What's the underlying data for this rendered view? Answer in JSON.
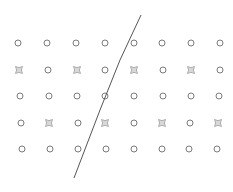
{
  "diagram": {
    "colors": {
      "circle": "#7a7a7a",
      "star": "#9a9a9a",
      "line": "#555555",
      "background": "#ffffff"
    },
    "grid": {
      "rows": [
        {
          "y": 43,
          "xs": [
            18,
            47,
            76,
            105,
            134,
            162,
            191,
            220
          ],
          "types": [
            "o",
            "o",
            "o",
            "o",
            "o",
            "o",
            "o",
            "o"
          ]
        },
        {
          "y": 70,
          "xs": [
            19,
            48,
            77,
            105,
            134,
            163,
            191,
            220
          ],
          "types": [
            "s",
            "o",
            "s",
            "o",
            "s",
            "o",
            "s",
            "o"
          ]
        },
        {
          "y": 96,
          "xs": [
            20,
            49,
            77,
            105,
            134,
            163,
            191,
            219
          ],
          "types": [
            "o",
            "o",
            "o",
            "o",
            "o",
            "o",
            "o",
            "o"
          ]
        },
        {
          "y": 123,
          "xs": [
            21,
            49,
            78,
            105,
            134,
            162,
            190,
            218
          ],
          "types": [
            "o",
            "s",
            "o",
            "s",
            "o",
            "s",
            "o",
            "s"
          ]
        },
        {
          "y": 149,
          "xs": [
            22,
            50,
            78,
            106,
            134,
            162,
            189,
            217
          ],
          "types": [
            "o",
            "o",
            "o",
            "o",
            "o",
            "o",
            "o",
            "o"
          ]
        }
      ]
    },
    "separator_line": {
      "points": [
        [
          141,
          15
        ],
        [
          120,
          60
        ],
        [
          100,
          110
        ],
        [
          74,
          178
        ]
      ]
    }
  }
}
